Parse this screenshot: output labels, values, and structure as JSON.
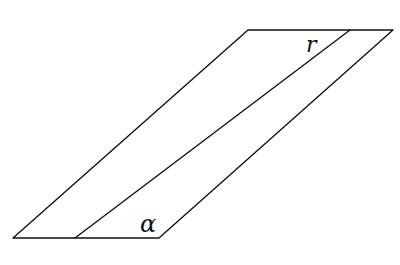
{
  "figure": {
    "type": "geometry-diagram",
    "plane": {
      "name": "alpha",
      "label": "α"
    },
    "line": {
      "name": "r",
      "label": "r"
    },
    "colors": {
      "stroke": "#111111",
      "background": "#ffffff"
    }
  }
}
